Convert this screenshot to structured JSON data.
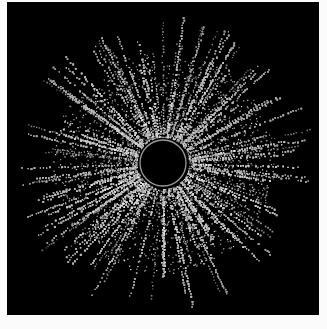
{
  "image": {
    "description": "Radial starburst of grainy white dots streaking outward from a dark circular hole, on a black square",
    "background_color": "#000000",
    "margin_color": "#fbfbfb",
    "frame": {
      "x": 7,
      "y": 2,
      "width": 312,
      "height": 313
    },
    "center": {
      "x": 156,
      "y": 161
    },
    "hole": {
      "radius": 23,
      "ring_color": "#9a9a9a",
      "ring_width": 1.3
    },
    "burst": {
      "inner_radius": 26,
      "outer_radius": 152,
      "ray_count": 420,
      "dot_color": "#d8d8d8",
      "dot_size": 1.3,
      "seed": 7
    }
  }
}
